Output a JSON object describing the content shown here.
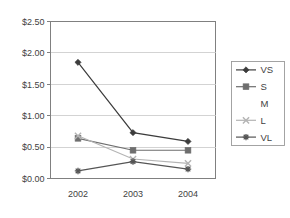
{
  "chart_data": {
    "type": "line",
    "title": "",
    "xlabel": "",
    "ylabel": "",
    "categories": [
      "2002",
      "2003",
      "2004"
    ],
    "x_tick_labels": [
      "2002",
      "2003",
      "2004"
    ],
    "y_tick_labels": [
      "$0.00",
      "$0.50",
      "$1.00",
      "$1.50",
      "$2.00",
      "$2.50"
    ],
    "y_tick_values": [
      0.0,
      0.5,
      1.0,
      1.5,
      2.0,
      2.5
    ],
    "ylim": [
      0.0,
      2.5
    ],
    "y_axis_format": "currency_usd",
    "grid": "horizontal",
    "legend_position": "right",
    "series": [
      {
        "name": "VS",
        "marker": "diamond",
        "color": "#3c3c3c",
        "values": [
          1.85,
          0.73,
          0.59
        ]
      },
      {
        "name": "S",
        "marker": "square",
        "color": "#6e6e6e",
        "values": [
          0.64,
          0.45,
          0.45
        ]
      },
      {
        "name": "M",
        "marker": "none",
        "color": "#ffffff",
        "values": [
          null,
          null,
          null
        ]
      },
      {
        "name": "L",
        "marker": "cross-x",
        "color": "#b4b4b4",
        "values": [
          0.68,
          0.31,
          0.24
        ]
      },
      {
        "name": "VL",
        "marker": "asterisk",
        "color": "#555555",
        "values": [
          0.12,
          0.27,
          0.15
        ]
      }
    ]
  },
  "legend": {
    "entries": [
      {
        "label": "VS"
      },
      {
        "label": "S"
      },
      {
        "label": "M"
      },
      {
        "label": "L"
      },
      {
        "label": "VL"
      }
    ]
  },
  "colors": {
    "plot_background": "#ffffff",
    "plot_border": "#808080",
    "gridline": "#c8c8c8",
    "legend_border": "#9a9a9a",
    "text": "#3f3f3f"
  }
}
